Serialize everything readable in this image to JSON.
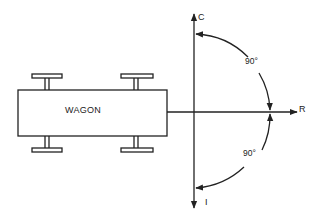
{
  "diagram": {
    "wagon": {
      "label": "WAGON"
    },
    "axes": {
      "up": "C",
      "right": "R",
      "down": "I"
    },
    "angles": {
      "upper": "90°",
      "lower": "90°"
    },
    "colors": {
      "ink": "#222222",
      "background": "#ffffff"
    }
  }
}
